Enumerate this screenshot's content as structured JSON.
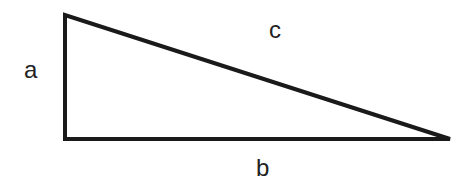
{
  "diagram": {
    "type": "right-triangle",
    "stroke_color": "#1a1a1a",
    "stroke_width": 4,
    "vertices": {
      "top": [
        65,
        15
      ],
      "right_angle": [
        65,
        139
      ],
      "right": [
        450,
        139
      ]
    },
    "labels": {
      "a": "a",
      "b": "b",
      "c": "c"
    }
  }
}
